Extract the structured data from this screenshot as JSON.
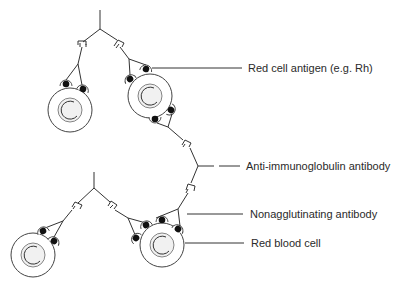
{
  "diagram": {
    "labels": [
      {
        "id": "red-cell-antigen",
        "text": "Red cell antigen (e.g. Rh)"
      },
      {
        "id": "anti-immunoglobulin-antibody",
        "text": "Anti-immunoglobulin antibody"
      },
      {
        "id": "nonagglutinating-antibody",
        "text": "Nonagglutinating antibody"
      },
      {
        "id": "red-blood-cell",
        "text": "Red blood cell"
      }
    ],
    "colors": {
      "stroke": "#333333",
      "antigen": "#111111",
      "cell_fill": "#ffffff",
      "cell_core": "#f1f1f1",
      "text": "#2a2a2a"
    }
  }
}
